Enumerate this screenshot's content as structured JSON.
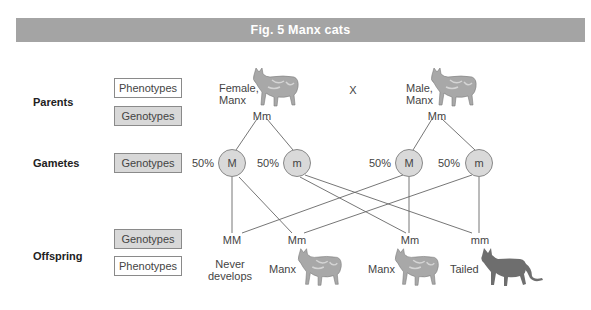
{
  "header": {
    "title": "Fig. 5  Manx cats"
  },
  "rows": {
    "parents": {
      "label": "Parents",
      "phenotypes_label": "Phenotypes",
      "genotypes_label": "Genotypes"
    },
    "gametes": {
      "label": "Gametes",
      "genotypes_label": "Genotypes"
    },
    "offspring": {
      "label": "Offspring",
      "genotypes_label": "Genotypes",
      "phenotypes_label": "Phenotypes"
    }
  },
  "parents": {
    "female": {
      "phenotype_line1": "Female,",
      "phenotype_line2": "Manx",
      "genotype": "Mm",
      "icon": "manx-cat-icon"
    },
    "cross_symbol": "X",
    "male": {
      "phenotype_line1": "Male,",
      "phenotype_line2": "Manx",
      "genotype": "Mm",
      "icon": "manx-cat-icon"
    }
  },
  "gametes": [
    {
      "allele": "M",
      "percent": "50%"
    },
    {
      "allele": "m",
      "percent": "50%"
    },
    {
      "allele": "M",
      "percent": "50%"
    },
    {
      "allele": "m",
      "percent": "50%"
    }
  ],
  "offspring": [
    {
      "genotype": "MM",
      "phenotype_line1": "Never",
      "phenotype_line2": "develops"
    },
    {
      "genotype": "Mm",
      "phenotype": "Manx",
      "icon": "manx-cat-icon"
    },
    {
      "genotype": "Mm",
      "phenotype": "Manx",
      "icon": "manx-cat-icon"
    },
    {
      "genotype": "mm",
      "phenotype": "Tailed",
      "icon": "tailed-cat-icon"
    }
  ],
  "colors": {
    "header_bg": "#a4a4a4",
    "genotype_box_bg": "#d8d8d8",
    "gamete_fill": "#d9d9d9",
    "manx_cat": "#a8a8a8",
    "tailed_cat": "#6e6e6e"
  }
}
